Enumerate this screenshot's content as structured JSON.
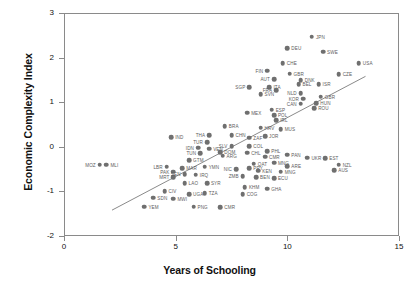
{
  "chart_data": {
    "type": "scatter",
    "title": "",
    "xlabel": "Years of Schooling",
    "ylabel": "Economic Complexity Index",
    "xlim": [
      0,
      15
    ],
    "ylim": [
      -2,
      3
    ],
    "xticks": [
      "0",
      "5",
      "10",
      "15"
    ],
    "xtick_values": [
      0,
      5,
      10,
      15
    ],
    "yticks": [
      "3",
      "2",
      "1",
      "0",
      "-1",
      "-2"
    ],
    "ytick_values": [
      3,
      2,
      1,
      0,
      -1,
      -2
    ],
    "grid": false,
    "legend": false,
    "point_color": "#6f6f6f",
    "fit_line": {
      "show": true,
      "color": "#8a8a8a",
      "x0": 2.15,
      "y0": -1.42,
      "x1": 13.5,
      "y1": 1.58
    },
    "points": [
      {
        "label": "JPN",
        "x": 11.1,
        "y": 2.47,
        "side": "right"
      },
      {
        "label": "DEU",
        "x": 10.0,
        "y": 2.21,
        "side": "right"
      },
      {
        "label": "SWE",
        "x": 11.6,
        "y": 2.13,
        "side": "right"
      },
      {
        "label": "USA",
        "x": 13.2,
        "y": 1.88,
        "side": "right"
      },
      {
        "label": "CHE",
        "x": 9.8,
        "y": 1.88,
        "side": "right"
      },
      {
        "label": "CZE",
        "x": 12.3,
        "y": 1.63,
        "side": "right"
      },
      {
        "label": "FIN",
        "x": 9.1,
        "y": 1.71,
        "side": "left"
      },
      {
        "label": "GBR",
        "x": 10.1,
        "y": 1.64,
        "side": "right"
      },
      {
        "label": "AUT",
        "x": 9.4,
        "y": 1.52,
        "side": "left"
      },
      {
        "label": "DNK",
        "x": 10.6,
        "y": 1.49,
        "side": "right"
      },
      {
        "label": "SGP",
        "x": 8.3,
        "y": 1.33,
        "side": "left"
      },
      {
        "label": "ITA",
        "x": 9.2,
        "y": 1.33,
        "side": "right"
      },
      {
        "label": "FRA",
        "x": 9.5,
        "y": 1.27,
        "side": "left"
      },
      {
        "label": "BEL",
        "x": 10.5,
        "y": 1.4,
        "side": "right"
      },
      {
        "label": "ISR",
        "x": 11.4,
        "y": 1.4,
        "side": "right"
      },
      {
        "label": "NLD",
        "x": 10.6,
        "y": 1.2,
        "side": "left"
      },
      {
        "label": "SVN",
        "x": 8.8,
        "y": 1.18,
        "side": "right"
      },
      {
        "label": "KOR",
        "x": 10.7,
        "y": 1.08,
        "side": "left"
      },
      {
        "label": "CAN",
        "x": 10.6,
        "y": 0.97,
        "side": "left"
      },
      {
        "label": "GBR2",
        "x": 11.5,
        "y": 1.12,
        "side": "right"
      },
      {
        "label": "HUN",
        "x": 11.3,
        "y": 0.98,
        "side": "right"
      },
      {
        "label": "ROU",
        "x": 11.2,
        "y": 0.86,
        "side": "right"
      },
      {
        "label": "ESP",
        "x": 9.3,
        "y": 0.83,
        "side": "right"
      },
      {
        "label": "POL",
        "x": 9.4,
        "y": 0.71,
        "side": "right"
      },
      {
        "label": "IRL",
        "x": 9.5,
        "y": 0.6,
        "side": "right"
      },
      {
        "label": "MEX",
        "x": 8.2,
        "y": 0.76,
        "side": "right"
      },
      {
        "label": "BRA",
        "x": 7.2,
        "y": 0.46,
        "side": "right"
      },
      {
        "label": "HRV",
        "x": 8.8,
        "y": 0.43,
        "side": "right"
      },
      {
        "label": "MUS",
        "x": 9.7,
        "y": 0.4,
        "side": "right"
      },
      {
        "label": "THA",
        "x": 6.5,
        "y": 0.26,
        "side": "left"
      },
      {
        "label": "CHN",
        "x": 7.5,
        "y": 0.26,
        "side": "right"
      },
      {
        "label": "ZAF",
        "x": 8.3,
        "y": 0.2,
        "side": "right"
      },
      {
        "label": "JOR",
        "x": 9.0,
        "y": 0.24,
        "side": "right"
      },
      {
        "label": "TUR",
        "x": 6.4,
        "y": 0.1,
        "side": "left"
      },
      {
        "label": "SLV",
        "x": 7.5,
        "y": 0.02,
        "side": "left"
      },
      {
        "label": "COL",
        "x": 8.3,
        "y": 0.02,
        "side": "right"
      },
      {
        "label": "IND",
        "x": 4.8,
        "y": 0.21,
        "side": "right"
      },
      {
        "label": "IDN",
        "x": 6.0,
        "y": -0.02,
        "side": "left"
      },
      {
        "label": "VEN",
        "x": 6.5,
        "y": -0.04,
        "side": "right"
      },
      {
        "label": "TUN",
        "x": 6.1,
        "y": -0.14,
        "side": "left"
      },
      {
        "label": "DOM",
        "x": 7.0,
        "y": -0.12,
        "side": "right"
      },
      {
        "label": "ARG",
        "x": 7.1,
        "y": -0.2,
        "side": "right"
      },
      {
        "label": "CHL",
        "x": 8.2,
        "y": -0.13,
        "side": "right"
      },
      {
        "label": "PHL",
        "x": 9.1,
        "y": -0.1,
        "side": "right"
      },
      {
        "label": "PAN",
        "x": 10.0,
        "y": -0.18,
        "side": "right"
      },
      {
        "label": "CMR",
        "x": 9.0,
        "y": -0.22,
        "side": "right"
      },
      {
        "label": "UKR",
        "x": 10.9,
        "y": -0.24,
        "side": "right"
      },
      {
        "label": "EST",
        "x": 11.7,
        "y": -0.26,
        "side": "right"
      },
      {
        "label": "NZL",
        "x": 12.3,
        "y": -0.4,
        "side": "right"
      },
      {
        "label": "AUS",
        "x": 12.1,
        "y": -0.52,
        "side": "right"
      },
      {
        "label": "QAT",
        "x": 8.5,
        "y": -0.38,
        "side": "right"
      },
      {
        "label": "MNG",
        "x": 9.4,
        "y": -0.36,
        "side": "right"
      },
      {
        "label": "ARE",
        "x": 10.0,
        "y": -0.44,
        "side": "right"
      },
      {
        "label": "NIC",
        "x": 7.7,
        "y": -0.5,
        "side": "left"
      },
      {
        "label": "PRY",
        "x": 8.3,
        "y": -0.48,
        "side": "right"
      },
      {
        "label": "KEN",
        "x": 8.7,
        "y": -0.54,
        "side": "right"
      },
      {
        "label": "MNG2",
        "x": 9.7,
        "y": -0.56,
        "side": "right"
      },
      {
        "label": "GTM",
        "x": 5.6,
        "y": -0.3,
        "side": "right"
      },
      {
        "label": "LBR",
        "x": 4.6,
        "y": -0.45,
        "side": "left"
      },
      {
        "label": "MAR",
        "x": 5.3,
        "y": -0.48,
        "side": "right"
      },
      {
        "label": "PAK",
        "x": 4.9,
        "y": -0.56,
        "side": "left"
      },
      {
        "label": "YMN",
        "x": 6.3,
        "y": -0.45,
        "side": "right"
      },
      {
        "label": "MRT",
        "x": 4.9,
        "y": -0.68,
        "side": "left"
      },
      {
        "label": "SEN",
        "x": 5.4,
        "y": -0.62,
        "side": "left"
      },
      {
        "label": "IRQ",
        "x": 5.9,
        "y": -0.63,
        "side": "right"
      },
      {
        "label": "BEN",
        "x": 8.6,
        "y": -0.68,
        "side": "right"
      },
      {
        "label": "ECU",
        "x": 9.4,
        "y": -0.71,
        "side": "right"
      },
      {
        "label": "ZMB",
        "x": 8.0,
        "y": -0.66,
        "side": "left"
      },
      {
        "label": "LAO",
        "x": 5.4,
        "y": -0.82,
        "side": "right"
      },
      {
        "label": "SYR",
        "x": 6.4,
        "y": -0.82,
        "side": "right"
      },
      {
        "label": "KHM",
        "x": 8.1,
        "y": -0.9,
        "side": "right"
      },
      {
        "label": "GHA",
        "x": 9.1,
        "y": -0.94,
        "side": "right"
      },
      {
        "label": "COG",
        "x": 8.0,
        "y": -1.06,
        "side": "right"
      },
      {
        "label": "CIV",
        "x": 4.5,
        "y": -1.0,
        "side": "right"
      },
      {
        "label": "UGA",
        "x": 5.6,
        "y": -1.06,
        "side": "right"
      },
      {
        "label": "TZA",
        "x": 6.3,
        "y": -1.04,
        "side": "right"
      },
      {
        "label": "SDN",
        "x": 4.0,
        "y": -1.14,
        "side": "right"
      },
      {
        "label": "MWI",
        "x": 4.9,
        "y": -1.16,
        "side": "right"
      },
      {
        "label": "YEM",
        "x": 3.6,
        "y": -1.34,
        "side": "right"
      },
      {
        "label": "PNG",
        "x": 5.8,
        "y": -1.34,
        "side": "right"
      },
      {
        "label": "CMR2",
        "x": 7.0,
        "y": -1.36,
        "side": "right"
      },
      {
        "label": "MOZ",
        "x": 1.6,
        "y": -0.4,
        "side": "left"
      },
      {
        "label": "MLI",
        "x": 1.9,
        "y": -0.4,
        "side": "right"
      }
    ]
  }
}
